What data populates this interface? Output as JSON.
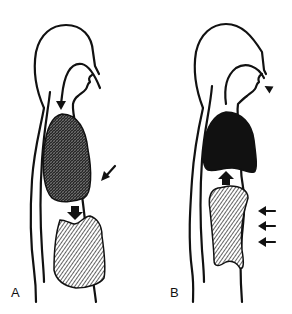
{
  "figure": {
    "panels": [
      {
        "label": "A",
        "phase": "inspiration",
        "airflow": "inward",
        "lungs": "expanded, cross-hatched",
        "diaphragm_arrow": "down",
        "side_arrows": 1
      },
      {
        "label": "B",
        "phase": "expiration",
        "airflow": "outward",
        "lungs": "solid black",
        "diaphragm_arrow": "up",
        "side_arrows": 3
      }
    ],
    "colors": {
      "ink": "#111111",
      "background": "#ffffff"
    }
  }
}
